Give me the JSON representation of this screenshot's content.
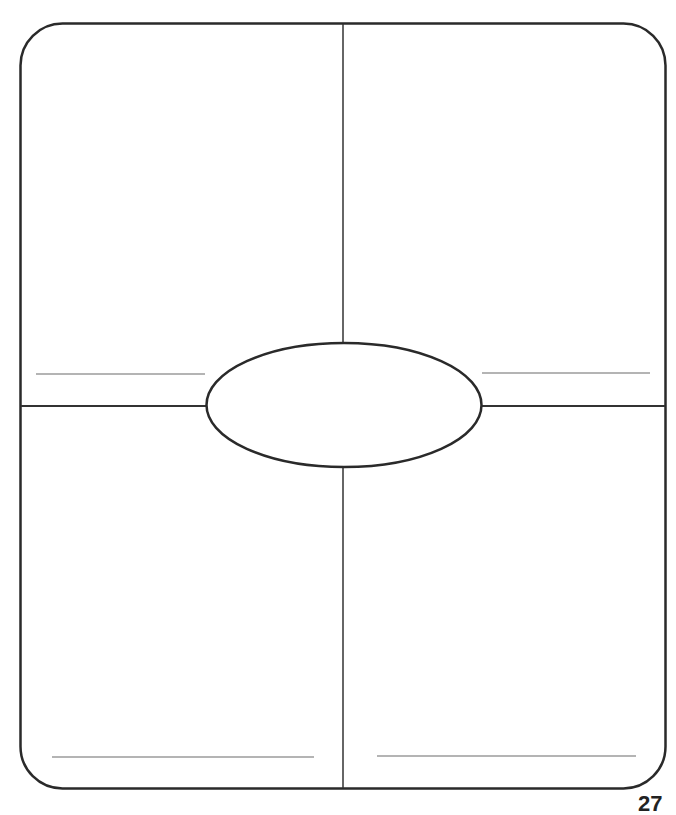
{
  "document": {
    "type": "four-square graphic organizer",
    "page_number": "27",
    "colors": {
      "stroke": "#2a2a2a",
      "writing_line": "#6a6a6a",
      "background": "#ffffff"
    },
    "quadrants": [
      {
        "position": "top-left",
        "answer_line": ""
      },
      {
        "position": "top-right",
        "answer_line": ""
      },
      {
        "position": "bottom-left",
        "answer_line": ""
      },
      {
        "position": "bottom-right",
        "answer_line": ""
      }
    ],
    "center_oval": {
      "text": ""
    }
  }
}
